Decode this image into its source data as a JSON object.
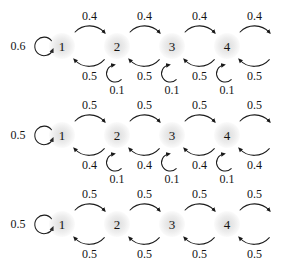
{
  "diagram": {
    "type": "state-transition-diagram",
    "node_labels": [
      "1",
      "2",
      "3",
      "4"
    ],
    "colors": {
      "stroke": "#1a1a1a",
      "text": "#141414",
      "background": "#ffffff",
      "node_halo": "#8c8c8c"
    },
    "rows": [
      {
        "id": "row-1",
        "self_loop_left": "0.6",
        "forward_labels": [
          "0.4",
          "0.4",
          "0.4",
          "0.4"
        ],
        "backward_labels": [
          "0.5",
          "0.5",
          "0.5",
          "0.5"
        ],
        "self_loop_bottom": [
          "0.1",
          "0.1",
          "0.1"
        ]
      },
      {
        "id": "row-2",
        "self_loop_left": "0.5",
        "forward_labels": [
          "0.5",
          "0.5",
          "0.5",
          "0.5"
        ],
        "backward_labels": [
          "0.4",
          "0.4",
          "0.4",
          "0.4"
        ],
        "self_loop_bottom": [
          "0.1",
          "0.1",
          "0.1"
        ]
      },
      {
        "id": "row-3",
        "self_loop_left": "0.5",
        "forward_labels": [
          "0.5",
          "0.5",
          "0.5",
          "0.5"
        ],
        "backward_labels": [
          "0.5",
          "0.5",
          "0.5",
          "0.5"
        ],
        "self_loop_bottom": []
      }
    ]
  }
}
